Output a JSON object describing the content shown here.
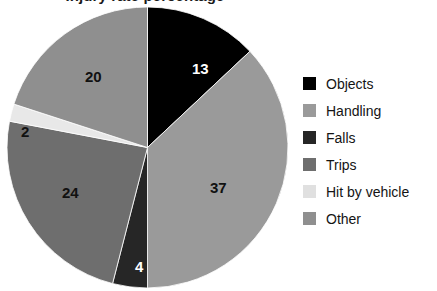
{
  "chart_data": {
    "type": "pie",
    "title": "Injury rate percentage",
    "categories": [
      "Objects",
      "Handling",
      "Falls",
      "Trips",
      "Hit by vehicle",
      "Other"
    ],
    "values": [
      13,
      37,
      4,
      24,
      2,
      20
    ],
    "units": "percent",
    "total": 100,
    "data_labels": [
      "13",
      "37",
      "4",
      "24",
      "2",
      "20"
    ],
    "colors": [
      "#000000",
      "#9a9a9a",
      "#262626",
      "#6e6e6e",
      "#e8e8e8",
      "#8f8f8f"
    ],
    "label_text_colors": [
      "#ffffff",
      "#111111",
      "#ffffff",
      "#111111",
      "#111111",
      "#111111"
    ],
    "start_angle_deg": 0,
    "direction": "clockwise",
    "legend_position": "right",
    "grid": false,
    "xlabel": "",
    "ylabel": "",
    "slices": [
      {
        "name": "Objects",
        "value": 13,
        "label": "13",
        "color": "#000000",
        "label_color": "#ffffff",
        "label_x": 185,
        "label_y": 54
      },
      {
        "name": "Handling",
        "value": 37,
        "label": "37",
        "color": "#9a9a9a",
        "label_color": "#111111",
        "label_x": 203,
        "label_y": 173
      },
      {
        "name": "Falls",
        "value": 4,
        "label": "4",
        "color": "#262626",
        "label_color": "#ffffff",
        "label_x": 128,
        "label_y": 252
      },
      {
        "name": "Trips",
        "value": 24,
        "label": "24",
        "color": "#6e6e6e",
        "label_color": "#111111",
        "label_x": 55,
        "label_y": 178
      },
      {
        "name": "Hit by vehicle",
        "value": 2,
        "label": "2",
        "color": "#e8e8e8",
        "label_color": "#111111",
        "label_x": 14,
        "label_y": 117
      },
      {
        "name": "Other",
        "value": 20,
        "label": "20",
        "color": "#8f8f8f",
        "label_color": "#111111",
        "label_x": 78,
        "label_y": 62
      }
    ]
  },
  "legend": {
    "items": [
      {
        "label": "Objects",
        "color": "#000000"
      },
      {
        "label": "Handling",
        "color": "#9a9a9a"
      },
      {
        "label": "Falls",
        "color": "#262626"
      },
      {
        "label": "Trips",
        "color": "#6e6e6e"
      },
      {
        "label": "Hit by vehicle",
        "color": "#e0e0e0"
      },
      {
        "label": "Other",
        "color": "#8f8f8f"
      }
    ]
  }
}
